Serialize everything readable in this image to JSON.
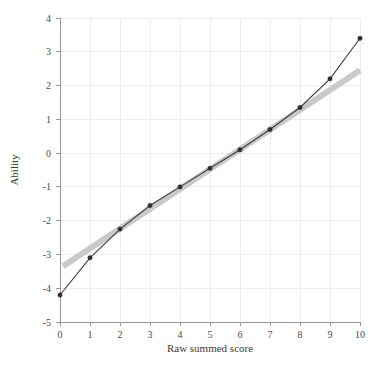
{
  "chart_data": {
    "type": "line",
    "title": "",
    "xlabel": "Raw summed score",
    "ylabel": "Ability",
    "xlim": [
      0,
      10
    ],
    "ylim": [
      -5,
      4
    ],
    "grid": true,
    "legend": "none",
    "xticks": [
      "0",
      "1",
      "2",
      "3",
      "4",
      "5",
      "6",
      "7",
      "8",
      "9",
      "10"
    ],
    "yticks": [
      "-5",
      "-4",
      "-3",
      "-2",
      "-1",
      "0",
      "1",
      "2",
      "3",
      "4"
    ],
    "x": [
      0,
      1,
      2,
      3,
      4,
      5,
      6,
      7,
      8,
      9,
      10
    ],
    "series": [
      {
        "name": "Ability estimate",
        "style": "line-with-markers",
        "color": "#2e2e38",
        "values": [
          -4.2,
          -3.1,
          -2.25,
          -1.55,
          -1.0,
          -0.45,
          0.1,
          0.7,
          1.35,
          2.2,
          3.4
        ]
      },
      {
        "name": "Linear reference",
        "style": "thick-straight-line",
        "color": "#c9c9c9",
        "x_endpoints": [
          0.1,
          10.0
        ],
        "y_endpoints": [
          -3.35,
          2.45
        ]
      }
    ]
  },
  "axes": {
    "x_title": "Raw summed score",
    "y_title": "Ability"
  }
}
